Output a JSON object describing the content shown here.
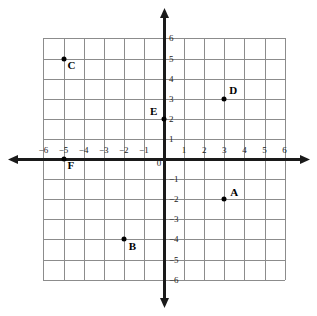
{
  "chart_data": {
    "type": "scatter",
    "title": "",
    "xlabel": "",
    "ylabel": "",
    "xlim": [
      -6,
      6
    ],
    "ylim": [
      -6,
      6
    ],
    "grid": true,
    "legend": "none",
    "x_ticks": [
      "-6",
      "-5",
      "-4",
      "-3",
      "-2",
      "-1",
      "0",
      "1",
      "2",
      "3",
      "4",
      "5",
      "6"
    ],
    "y_ticks": [
      "6",
      "5",
      "4",
      "3",
      "2",
      "1",
      "-1",
      "-2",
      "-3",
      "-4",
      "-5",
      "-6"
    ],
    "points": [
      {
        "label": "A",
        "x": 3,
        "y": -2,
        "label_dx": 6,
        "label_dy": -12
      },
      {
        "label": "B",
        "x": -2,
        "y": -4,
        "label_dx": 5,
        "label_dy": 2
      },
      {
        "label": "C",
        "x": -5,
        "y": 5,
        "label_dx": 4,
        "label_dy": 1
      },
      {
        "label": "D",
        "x": 3,
        "y": 3,
        "label_dx": 5,
        "label_dy": -14
      },
      {
        "label": "E",
        "x": 0,
        "y": 2,
        "label_dx": -14,
        "label_dy": -13
      },
      {
        "label": "F",
        "x": -5,
        "y": 0,
        "label_dx": 4,
        "label_dy": 1
      }
    ]
  },
  "style": {
    "grid_color": "#8c8c8c",
    "axis_color": "#1a1a1a",
    "point_color": "#000000",
    "background": "#ffffff"
  },
  "geometry": {
    "origin_x": 164,
    "origin_y": 159,
    "unit": 20.1,
    "x_axis_left": 8,
    "x_axis_right": 310,
    "y_axis_top": 8,
    "y_axis_bottom": 308
  }
}
